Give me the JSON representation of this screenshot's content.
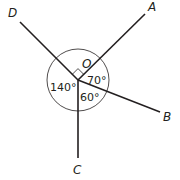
{
  "diagram": {
    "center": {
      "label": "O",
      "x": 78,
      "y": 80
    },
    "rays": [
      {
        "label": "D",
        "end": [
          20,
          22
        ]
      },
      {
        "label": "A",
        "end": [
          145,
          14
        ]
      },
      {
        "label": "B",
        "end": [
          160,
          112
        ]
      },
      {
        "label": "C",
        "end": [
          78,
          158
        ]
      }
    ],
    "angles": [
      {
        "between": "DOA",
        "value": "90°",
        "marker": "right-angle"
      },
      {
        "between": "AOB",
        "label": "70°"
      },
      {
        "between": "BOC",
        "label": "60°"
      },
      {
        "between": "COD",
        "label": "140°"
      }
    ],
    "labels": {
      "O": "O",
      "A": "A",
      "B": "B",
      "C": "C",
      "D": "D",
      "angle_AOB": "70°",
      "angle_BOC": "60°",
      "angle_COD": "140°"
    }
  }
}
